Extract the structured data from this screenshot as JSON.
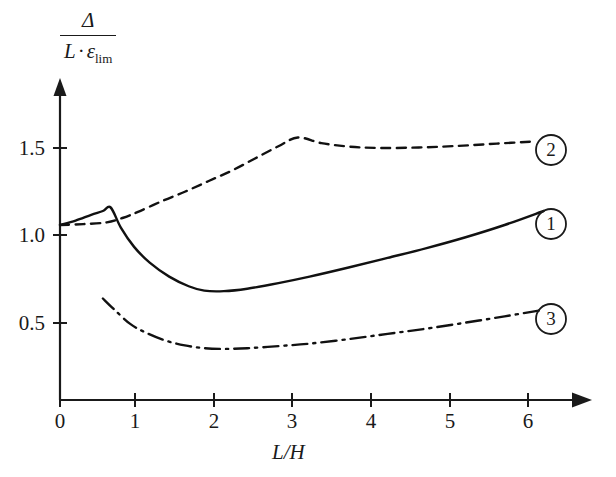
{
  "chart_data": {
    "type": "line",
    "title": "",
    "xlabel": "L/H",
    "ylabel_numerator": "Δ",
    "ylabel_denominator_main": "L · ε",
    "ylabel_denominator_sub": "lim",
    "xlim": [
      0,
      6.6
    ],
    "ylim": [
      0,
      1.78
    ],
    "grid": false,
    "legend_position": "right-inline-markers",
    "xticks": [
      0,
      1,
      2,
      3,
      4,
      5,
      6
    ],
    "xtick_labels": [
      "0",
      "1",
      "2",
      "3",
      "4",
      "5",
      "6"
    ],
    "yticks": [
      0.5,
      1.0,
      1.5
    ],
    "ytick_labels": [
      "0.5",
      "1.0",
      "1.5"
    ],
    "series": [
      {
        "name": "1",
        "label": "1",
        "style": "solid",
        "color": "#111111",
        "end_marker_value": "1",
        "x": [
          0.0,
          0.2,
          0.4,
          0.55,
          0.65,
          0.78,
          0.95,
          1.15,
          1.4,
          1.65,
          1.85,
          2.1,
          2.4,
          2.8,
          3.2,
          3.7,
          4.2,
          4.7,
          5.2,
          5.7,
          6.2
        ],
        "y": [
          1.0,
          1.025,
          1.058,
          1.08,
          1.1,
          0.985,
          0.875,
          0.785,
          0.705,
          0.65,
          0.625,
          0.622,
          0.636,
          0.668,
          0.705,
          0.757,
          0.812,
          0.868,
          0.93,
          1.0,
          1.08
        ]
      },
      {
        "name": "2",
        "label": "2",
        "style": "dashed",
        "color": "#111111",
        "end_marker_value": "2",
        "x": [
          0.0,
          0.3,
          0.6,
          0.8,
          1.0,
          1.3,
          1.6,
          1.9,
          2.2,
          2.5,
          2.8,
          3.05,
          3.35,
          3.7,
          4.1,
          4.6,
          5.1,
          5.6,
          6.1
        ],
        "y": [
          1.0,
          1.005,
          1.015,
          1.04,
          1.075,
          1.135,
          1.19,
          1.25,
          1.31,
          1.38,
          1.45,
          1.5,
          1.468,
          1.448,
          1.44,
          1.443,
          1.452,
          1.465,
          1.478
        ]
      },
      {
        "name": "3",
        "label": "3",
        "style": "dash-dot",
        "color": "#111111",
        "end_marker_value": "3",
        "x": [
          0.55,
          0.7,
          0.9,
          1.1,
          1.35,
          1.6,
          1.85,
          2.1,
          2.4,
          2.8,
          3.2,
          3.7,
          4.2,
          4.7,
          5.2,
          5.7,
          6.15
        ],
        "y": [
          0.58,
          0.515,
          0.435,
          0.385,
          0.34,
          0.312,
          0.296,
          0.292,
          0.296,
          0.308,
          0.322,
          0.348,
          0.378,
          0.408,
          0.442,
          0.478,
          0.512
        ]
      }
    ]
  },
  "markers": [
    {
      "name": "curve-marker-2",
      "value": "2",
      "cx": 551,
      "cy": 150
    },
    {
      "name": "curve-marker-1",
      "value": "1",
      "cx": 551,
      "cy": 224
    },
    {
      "name": "curve-marker-3",
      "value": "3",
      "cx": 551,
      "cy": 319
    }
  ],
  "axis": {
    "x_title": "L/H",
    "y_numerator": "Δ",
    "y_den_l": "L",
    "y_den_dot": "·",
    "y_den_eps": "ε",
    "y_den_sub": "lim"
  }
}
